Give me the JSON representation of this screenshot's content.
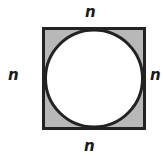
{
  "diagram": {
    "labels": {
      "top": "n",
      "left": "n",
      "right": "n",
      "bottom": "n"
    },
    "colors": {
      "shaded_fill": "#b8b8b8",
      "circle_fill": "#ffffff",
      "stroke": "#222222"
    }
  }
}
